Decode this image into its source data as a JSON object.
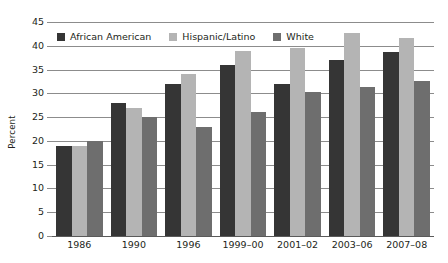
{
  "chart_data": {
    "type": "bar",
    "title": "",
    "subtitle": "",
    "xlabel": "",
    "ylabel": "Percent",
    "ylim": [
      0,
      45
    ],
    "ytick_step": 5,
    "yticks": [
      "0",
      "5",
      "10",
      "15",
      "20",
      "25",
      "30",
      "35",
      "40",
      "45"
    ],
    "grid": true,
    "grid_axis": "y",
    "legend_position": "top-left-inside",
    "categories": [
      "1986",
      "1990",
      "1996",
      "1999–00",
      "2001–02",
      "2003–06",
      "2007–08"
    ],
    "series": [
      {
        "name": "African American",
        "color": "#353535",
        "values": [
          19,
          28,
          32,
          36,
          32,
          37,
          38.8
        ]
      },
      {
        "name": "Hispanic/Latino",
        "color": "#b4b4b4",
        "values": [
          19,
          27,
          34,
          39,
          39.5,
          42.7,
          41.7
        ]
      },
      {
        "name": "White",
        "color": "#6e6e6e",
        "values": [
          20,
          25,
          23,
          26,
          30.2,
          31.4,
          32.5
        ]
      }
    ]
  },
  "axis": {
    "y_title": "Percent"
  }
}
